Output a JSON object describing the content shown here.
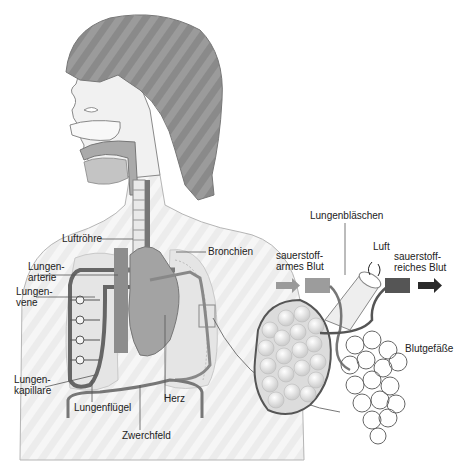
{
  "labels": {
    "luftroehre": "Luftröhre",
    "bronchien": "Bronchien",
    "lungenarterie": "Lungen-\narterie",
    "lungenvene": "Lungen-\nvene",
    "lungenkapillare": "Lungen-\nkapillare",
    "lungenfluegel": "Lungenflügel",
    "zwerchfeld": "Zwerchfeld",
    "herz": "Herz",
    "lungenblaeschen": "Lungenbläschen",
    "sauerstoffarmes_blut": "sauerstoff-\narmes Blut",
    "sauerstoffreiches_blut": "sauerstoff-\nreiches Blut",
    "luft": "Luft",
    "blutgefaesse": "Blutgefäße"
  },
  "colors": {
    "hair": "#8c8c8c",
    "skin": "#f4f4f4",
    "outline": "#7a7a7a",
    "vessel_dark": "#5e5e5e",
    "vessel_mid": "#8e8e8e",
    "heart": "#9a9a9a",
    "lung": "#e2e2e2",
    "arrow_light": "#9a9a9a",
    "arrow_dark": "#2a2a2a"
  }
}
